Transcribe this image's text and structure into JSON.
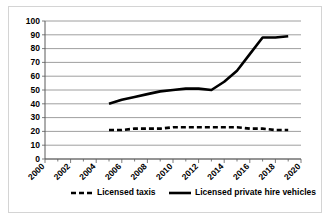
{
  "chart_data": {
    "type": "line",
    "title": "",
    "xlabel": "",
    "ylabel": "",
    "xlim": [
      2000,
      2020
    ],
    "ylim": [
      0,
      100
    ],
    "grid": true,
    "legend_position": "bottom",
    "y_ticks": [
      0,
      10,
      20,
      30,
      40,
      50,
      60,
      70,
      80,
      90,
      100
    ],
    "y_tick_labels": [
      "0",
      "10",
      "20",
      "30",
      "40",
      "50",
      "60",
      "70",
      "80",
      "90",
      "100"
    ],
    "x_ticks": [
      2000,
      2002,
      2004,
      2006,
      2008,
      2010,
      2012,
      2014,
      2016,
      2018,
      2020
    ],
    "x_tick_labels": [
      "2000",
      "2002",
      "2004",
      "2006",
      "2008",
      "2010",
      "2012",
      "2014",
      "2016",
      "2018",
      "2020"
    ],
    "x_minor_tick_step": 1,
    "series": [
      {
        "name": "Licensed taxis",
        "style": "dashed",
        "color": "#000000",
        "x": [
          2005,
          2006,
          2007,
          2008,
          2009,
          2010,
          2011,
          2012,
          2013,
          2014,
          2015,
          2016,
          2017,
          2018,
          2019
        ],
        "values": [
          21,
          21,
          22,
          22,
          22,
          23,
          23,
          23,
          23,
          23,
          23,
          22,
          22,
          21,
          21
        ]
      },
      {
        "name": "Licensed private hire vehicles",
        "style": "solid",
        "color": "#000000",
        "x": [
          2005,
          2006,
          2007,
          2008,
          2009,
          2010,
          2011,
          2012,
          2013,
          2014,
          2015,
          2016,
          2017,
          2018,
          2019
        ],
        "values": [
          40,
          43,
          45,
          47,
          49,
          50,
          51,
          51,
          50,
          56,
          64,
          76,
          88,
          88,
          89
        ]
      }
    ]
  },
  "legend": {
    "items": [
      {
        "label": "Licensed taxis",
        "style": "dashed"
      },
      {
        "label": "Licensed private hire vehicles",
        "style": "solid"
      }
    ]
  }
}
